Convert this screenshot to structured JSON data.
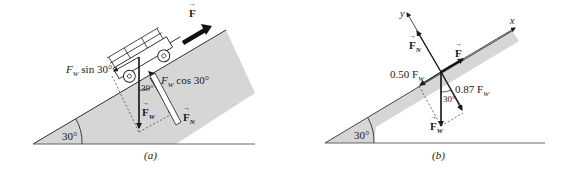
{
  "figure": {
    "panels": [
      {
        "id": "a",
        "caption": "(a)",
        "incline_angle_label": "30°",
        "labels": {
          "force_applied": "F",
          "weight_sin": "F",
          "weight_sin_sub": "W",
          "weight_sin_rest": " sin 30°",
          "weight_cos": "F",
          "weight_cos_sub": "W",
          "weight_cos_rest": " cos 30°",
          "angle_between": "30°",
          "weight": "F",
          "weight_sub": "W",
          "normal": "F",
          "normal_sub": "N"
        }
      },
      {
        "id": "b",
        "caption": "(b)",
        "incline_angle_label": "30°",
        "labels": {
          "y_axis": "y",
          "x_axis": "x",
          "normal": "F",
          "normal_sub": "N",
          "force_applied": "F",
          "parallel_component": "0.50 F",
          "parallel_component_sub": "W",
          "perpendicular_component": "0.87 F",
          "perpendicular_component_sub": "W",
          "angle_between": "30°",
          "weight": "F",
          "weight_sub": "W"
        }
      }
    ],
    "colors": {
      "incline_fill": "#d4d4d4",
      "line": "#1a1a1a",
      "background": "#ffffff"
    }
  }
}
